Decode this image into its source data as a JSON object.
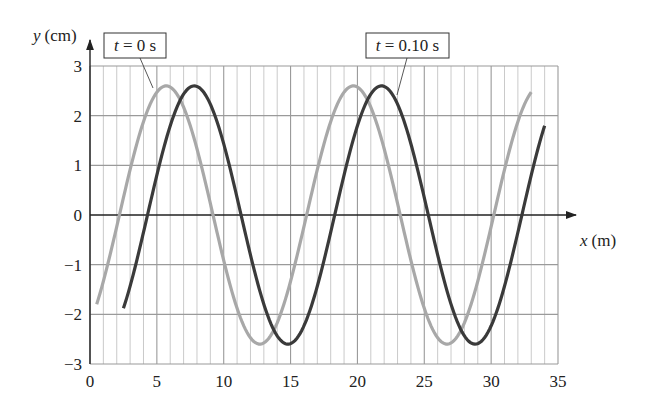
{
  "chart_data": {
    "type": "line",
    "title": "",
    "xlabel": "x (m)",
    "ylabel": "y (cm)",
    "xlabel_var": "x",
    "xlabel_unit": "(m)",
    "ylabel_var": "y",
    "ylabel_unit": "(cm)",
    "xlim": [
      0,
      35
    ],
    "ylim": [
      -3,
      3
    ],
    "x_ticks": [
      0,
      5,
      10,
      15,
      20,
      25,
      30,
      35
    ],
    "y_ticks": [
      -3,
      -2,
      -1,
      0,
      1,
      2,
      3
    ],
    "x_tick_labels": [
      "0",
      "5",
      "10",
      "15",
      "20",
      "25",
      "30",
      "35"
    ],
    "y_tick_labels": [
      "−3",
      "−2",
      "−1",
      "0",
      "1",
      "2",
      "3"
    ],
    "grid": {
      "vertical_every": 1,
      "horizontal_every": 1,
      "on": true
    },
    "series": [
      {
        "name": "t = 0 s",
        "label_var": "t",
        "label_rest": " = 0 s",
        "color": "#a8a8a8",
        "amplitude": 2.6,
        "wavelength": 14,
        "first_peak_x": 5.7,
        "x_start": 0.5,
        "x_end": 33.0,
        "key_points": [
          {
            "x": 0.5,
            "y": -2.0
          },
          {
            "x": 5.7,
            "y": 2.6
          },
          {
            "x": 12.7,
            "y": -2.6
          },
          {
            "x": 19.7,
            "y": 2.6
          },
          {
            "x": 26.7,
            "y": -2.6
          },
          {
            "x": 33.0,
            "y": 2.5
          }
        ]
      },
      {
        "name": "t = 0.10 s",
        "label_var": "t",
        "label_rest": " = 0.10 s",
        "color": "#3a3a3a",
        "amplitude": 2.6,
        "wavelength": 14,
        "first_peak_x": 7.8,
        "x_start": 2.5,
        "x_end": 34.0,
        "key_points": [
          {
            "x": 2.5,
            "y": -2.0
          },
          {
            "x": 7.8,
            "y": 2.6
          },
          {
            "x": 14.8,
            "y": -2.6
          },
          {
            "x": 21.8,
            "y": 2.6
          },
          {
            "x": 28.8,
            "y": -2.6
          },
          {
            "x": 34.0,
            "y": 1.8
          }
        ]
      }
    ],
    "annotations": [
      {
        "text": "t = 0 s",
        "points_to_series": 0
      },
      {
        "text": "t = 0.10 s",
        "points_to_series": 1
      }
    ],
    "legend": "callout boxes with leader lines"
  }
}
